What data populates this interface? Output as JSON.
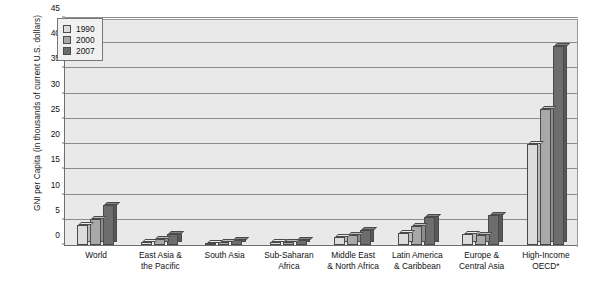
{
  "chart_data": {
    "type": "bar",
    "title": "",
    "xlabel": "",
    "ylabel_line1": "GNI per Capita",
    "ylabel_line2": "(in thousands of current U.S. dollars)",
    "ylim": [
      0,
      45
    ],
    "ytick_labels": [
      "0",
      "5",
      "10",
      "15",
      "20",
      "25",
      "30",
      "35",
      "40",
      "45"
    ],
    "ytick_values": [
      0,
      5,
      10,
      15,
      20,
      25,
      30,
      35,
      40,
      45
    ],
    "grid": true,
    "legend_position": "top-left-inside",
    "categories": [
      [
        "World"
      ],
      [
        "East Asia &",
        "the Pacific"
      ],
      [
        "South Asia"
      ],
      [
        "Sub-Saharan",
        "Africa"
      ],
      [
        "Middle East",
        "& North Africa"
      ],
      [
        "Latin America",
        "& Caribbean"
      ],
      [
        "Europe &",
        "Central Asia"
      ],
      [
        "High-Income",
        "OECD*"
      ]
    ],
    "series": [
      {
        "name": "1990",
        "color": "#dcdcdc",
        "values": [
          4.0,
          0.6,
          0.4,
          0.6,
          1.6,
          2.4,
          2.2,
          20.0
        ]
      },
      {
        "name": "2000",
        "color": "#a8a8a8",
        "values": [
          5.2,
          1.1,
          0.5,
          0.5,
          2.0,
          3.8,
          2.0,
          27.0
        ]
      },
      {
        "name": "2007",
        "color": "#6d6d6d",
        "values": [
          7.9,
          2.2,
          0.9,
          1.0,
          3.0,
          5.5,
          6.0,
          39.5
        ]
      }
    ]
  }
}
